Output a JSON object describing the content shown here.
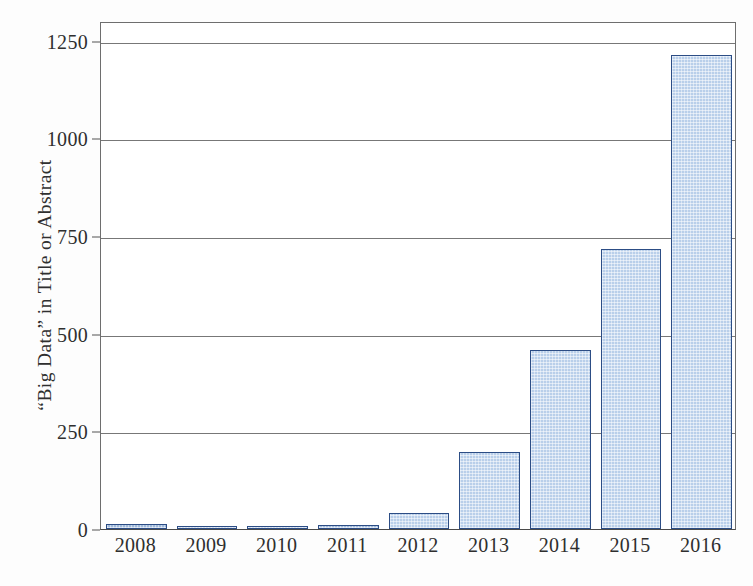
{
  "chart_data": {
    "type": "bar",
    "title": "",
    "subtitle": "",
    "xlabel": "",
    "ylabel": "“Big Data” in Title or Abstract",
    "categories": [
      "2008",
      "2009",
      "2010",
      "2011",
      "2012",
      "2013",
      "2014",
      "2015",
      "2016"
    ],
    "values": [
      13,
      8,
      8,
      10,
      40,
      196,
      458,
      717,
      1213
    ],
    "series": [
      {
        "name": "“Big Data” in Title or Abstract",
        "values": [
          13,
          8,
          8,
          10,
          40,
          196,
          458,
          717,
          1213
        ]
      }
    ],
    "ylim": [
      0,
      1300
    ],
    "yticks": [
      0,
      250,
      500,
      750,
      1000,
      1250
    ],
    "ytick_labels": [
      "0",
      "250",
      "500",
      "750",
      "1000",
      "1250"
    ],
    "xtick_labels": [
      "2008",
      "2009",
      "2010",
      "2011",
      "2012",
      "2013",
      "2014",
      "2015",
      "2016"
    ],
    "grid": "horizontal",
    "legend": "none",
    "bar_fill_color": "#b9cfea",
    "bar_edge_color": "#2c4d85",
    "axis_color": "#6e6e6e",
    "gridline_color": "#777777",
    "background_color": "#ffffff"
  }
}
